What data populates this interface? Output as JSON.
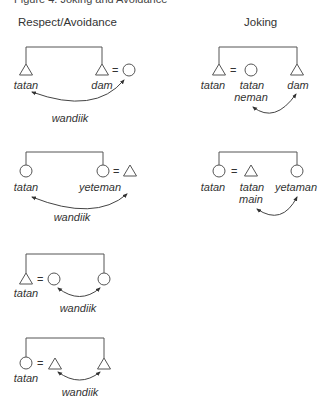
{
  "figure": {
    "caption": "Figure 4. Joking and Avoidance"
  },
  "columns": {
    "left_title": "Respect/Avoidance",
    "right_title": "Joking"
  },
  "symbols": {
    "male": "triangle",
    "female": "circle",
    "equals": "="
  },
  "diagrams": {
    "avoid1": {
      "left_label": "tatan",
      "right_label": "dam",
      "relation_label": "wandiik"
    },
    "avoid2": {
      "left_label": "tatan",
      "right_label": "yeteman",
      "relation_label": "wandiik"
    },
    "avoid3": {
      "left_label": "tatan",
      "relation_label": "wandiik"
    },
    "avoid4": {
      "left_label": "tatan",
      "relation_label": "wandiik"
    },
    "joke1": {
      "left_label": "tatan",
      "spouse_label_1": "tatan",
      "spouse_label_2": "neman",
      "right_label": "dam"
    },
    "joke2": {
      "left_label": "tatan",
      "spouse_label_1": "tatan",
      "spouse_label_2": "main",
      "right_label": "yetaman"
    }
  }
}
